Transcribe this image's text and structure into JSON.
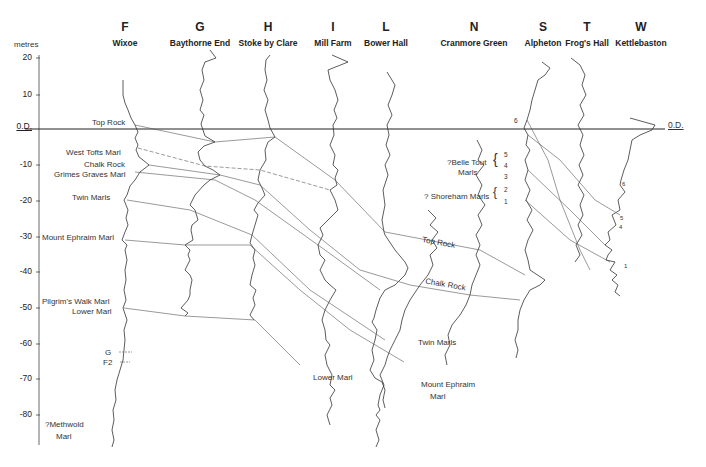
{
  "axis": {
    "unit": "metres",
    "datum_label": "0.D.",
    "ticks": [
      "20",
      "10",
      "0.D.",
      "-10",
      "-20",
      "-30",
      "-40",
      "-50",
      "-60",
      "-70",
      "-80"
    ],
    "tick_values": [
      20,
      10,
      0,
      -10,
      -20,
      -30,
      -40,
      -50,
      -60,
      -70,
      -80
    ]
  },
  "boreholes": [
    {
      "letter": "F",
      "name": "Wixoe",
      "x": 127
    },
    {
      "letter": "G",
      "name": "Baythorne End",
      "x": 200
    },
    {
      "letter": "H",
      "name": "Stoke by Clare",
      "x": 268
    },
    {
      "letter": "I",
      "name": "Mill Farm",
      "x": 333
    },
    {
      "letter": "L",
      "name": "Bower Hall",
      "x": 386
    },
    {
      "letter": "N",
      "name": "Cranmore Green",
      "x": 474
    },
    {
      "letter": "S",
      "name": "Alpheton",
      "x": 543
    },
    {
      "letter": "T",
      "name": "Frog's Hall",
      "x": 587
    },
    {
      "letter": "W",
      "name": "Kettlebaston",
      "x": 641
    }
  ],
  "marker_labels_left": [
    {
      "label": "Top Rock",
      "depth": 0
    },
    {
      "label": "West Tofts Marl",
      "depth": -7
    },
    {
      "label": "Chalk Rock",
      "depth": -10.5
    },
    {
      "label": "Grimes Graves Marl",
      "depth": -13
    },
    {
      "label": "Twin Marls",
      "depth": -19
    },
    {
      "label": "Mount Ephraim Marl",
      "depth": -30
    },
    {
      "label": "Pilgrim's Walk Marl",
      "depth": -47
    },
    {
      "label": "Lower Marl",
      "depth": -50
    },
    {
      "label": "G",
      "depth": -62
    },
    {
      "label": "F2",
      "depth": -65
    },
    {
      "label": "?Methwold",
      "depth": -85
    },
    {
      "label": "Marl",
      "depth": -88
    }
  ],
  "marker_labels_right": [
    {
      "label": "Top Rock"
    },
    {
      "label": "Chalk Rock"
    },
    {
      "label": "Twin Marls"
    },
    {
      "label": "Lower Marl"
    },
    {
      "label": "Mount Ephraim"
    },
    {
      "label": "Marl"
    }
  ],
  "cranmore_annotations": {
    "belle_tout": "?Belle Tout",
    "belle_tout_2": "Marls",
    "belle_numbers": [
      "5",
      "4",
      "3"
    ],
    "shoreham": "? Shoreham Marls",
    "shoreham_numbers": [
      "2",
      "1"
    ]
  },
  "alpheton_marker": "6",
  "kettlebaston_markers": [
    "6",
    "5",
    "4",
    "1"
  ],
  "datum_right_label": "0.D."
}
